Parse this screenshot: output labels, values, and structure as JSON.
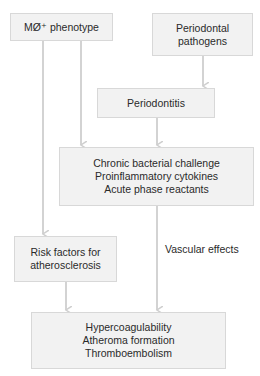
{
  "diagram": {
    "nodes": {
      "macrophage": {
        "lines": [
          "MØ⁺ phenotype"
        ]
      },
      "pathogens": {
        "lines": [
          "Periodontal",
          "pathogens"
        ]
      },
      "periodontitis": {
        "lines": [
          "Periodontitis"
        ]
      },
      "challenge": {
        "lines": [
          "Chronic bacterial challenge",
          "Proinflammatory cytokines",
          "Acute phase reactants"
        ]
      },
      "risk": {
        "lines": [
          "Risk factors for",
          "atherosclerosis"
        ]
      },
      "outcome": {
        "lines": [
          "Hypercoagulability",
          "Atheroma formation",
          "Thromboembolism"
        ]
      }
    },
    "edge_labels": {
      "vascular": "Vascular effects"
    },
    "colors": {
      "box_fill": "#f2f2f2",
      "box_border": "#d8d8d8",
      "arrow": "#cfcfcf",
      "text": "#2a2a2a"
    }
  }
}
